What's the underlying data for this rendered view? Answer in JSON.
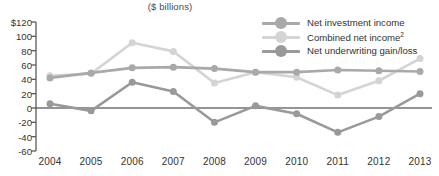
{
  "chart_data": {
    "type": "line",
    "title": "",
    "subtitle": "($ billions)",
    "xlabel": "",
    "ylabel": "",
    "categories": [
      "2004",
      "2005",
      "2006",
      "2007",
      "2008",
      "2009",
      "2010",
      "2011",
      "2012",
      "2013"
    ],
    "ylim": [
      -60,
      120
    ],
    "ytick_values": [
      120,
      100,
      80,
      60,
      40,
      20,
      0,
      -20,
      -40,
      -60
    ],
    "ytick_labels": [
      "$120",
      "100",
      "80",
      "60",
      "40",
      "20",
      "0",
      "-20",
      "-40",
      "-60"
    ],
    "grid": false,
    "zero_line": true,
    "legend_position": "top-right",
    "series": [
      {
        "name": "Net investment income",
        "color": "#a9a9a9",
        "values": [
          42,
          49,
          56,
          57,
          55,
          50,
          50,
          53,
          52,
          51
        ]
      },
      {
        "name": "Combined net income",
        "name_superscript": "2",
        "color": "#d4d4d4",
        "values": [
          45,
          48,
          91,
          79,
          35,
          50,
          43,
          18,
          38,
          69
        ]
      },
      {
        "name": "Net underwriting gain/loss",
        "color": "#999999",
        "values": [
          6,
          -4,
          36,
          23,
          -20,
          3,
          -8,
          -34,
          -12,
          20
        ]
      }
    ]
  },
  "legend": {
    "items": [
      {
        "label": "Net investment income",
        "sup": ""
      },
      {
        "label": "Combined net income",
        "sup": "2"
      },
      {
        "label": "Net underwriting gain/loss",
        "sup": ""
      }
    ]
  }
}
